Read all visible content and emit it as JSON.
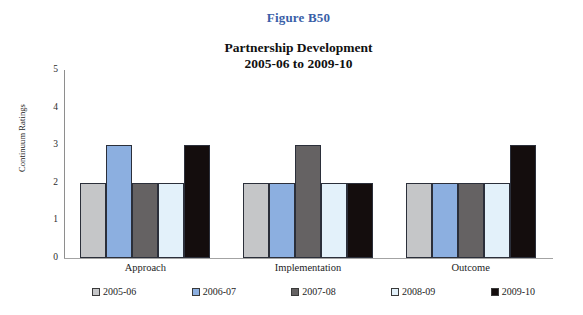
{
  "figure_label": "Figure B50",
  "title_line1": "Partnership Development",
  "title_line2": "2005-06 to 2009-10",
  "accent_color": "#3a5fa8",
  "chart_data": {
    "type": "bar",
    "title": "Partnership Development\n2005-06 to 2009-10",
    "figure_label": "Figure B50",
    "xlabel": "",
    "ylabel": "Continuum Ratings",
    "ylim": [
      0,
      5
    ],
    "yticks": [
      "0",
      "1",
      "2",
      "3",
      "4",
      "5"
    ],
    "grid": false,
    "legend_position": "bottom",
    "categories": [
      "Approach",
      "Implementation",
      "Outcome"
    ],
    "series": [
      {
        "name": "2005-06",
        "color": "#c5c6c8",
        "values": [
          2,
          2,
          2
        ]
      },
      {
        "name": "2006-07",
        "color": "#8cafe0",
        "values": [
          3,
          2,
          2
        ]
      },
      {
        "name": "2007-08",
        "color": "#656263",
        "values": [
          2,
          3,
          2
        ]
      },
      {
        "name": "2008-09",
        "color": "#e3f1fa",
        "values": [
          2,
          2,
          2
        ]
      },
      {
        "name": "2009-10",
        "color": "#140d0d",
        "values": [
          3,
          2,
          3
        ]
      }
    ]
  }
}
